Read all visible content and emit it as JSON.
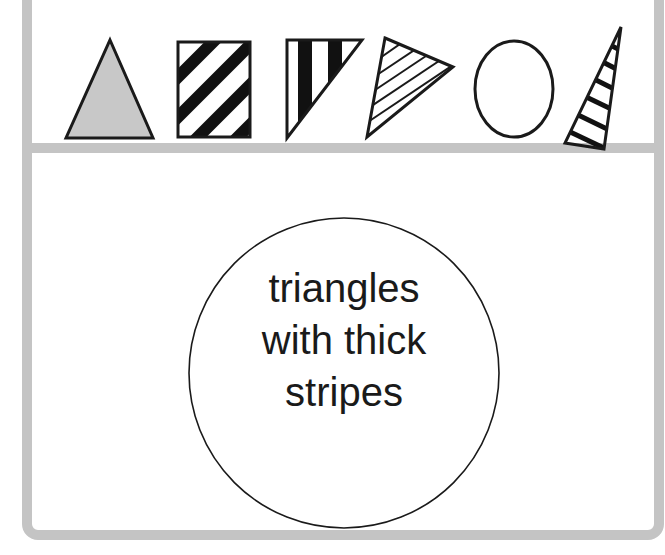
{
  "shapes_row": {
    "items": [
      {
        "id": "shape-1",
        "shape": "triangle",
        "fill": "gray",
        "fill_color": "#c8c8c8"
      },
      {
        "id": "shape-2",
        "shape": "square",
        "fill": "thick diagonal stripes"
      },
      {
        "id": "shape-3",
        "shape": "right triangle",
        "fill": "thick vertical stripes"
      },
      {
        "id": "shape-4",
        "shape": "triangle",
        "fill": "thin diagonal stripes"
      },
      {
        "id": "shape-5",
        "shape": "circle",
        "fill": "none"
      },
      {
        "id": "shape-6",
        "shape": "narrow triangle",
        "fill": "thick diagonal stripes"
      }
    ]
  },
  "rule_circle": {
    "lines": [
      "triangles",
      "with thick",
      "stripes"
    ]
  },
  "colors": {
    "frame": "#c4c4c4",
    "stroke": "#1a1a1a",
    "gray_fill": "#c8c8c8"
  }
}
